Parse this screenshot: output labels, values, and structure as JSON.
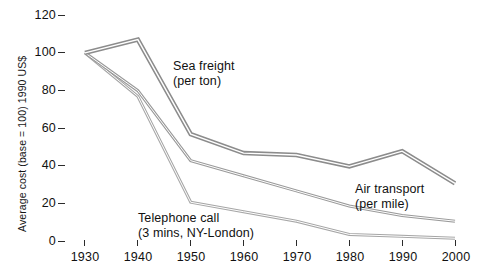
{
  "chart_data": {
    "type": "line",
    "title": "",
    "subtitle": "",
    "xlabel": "",
    "ylabel": "Average cost (base = 100) 1990 US$",
    "x": [
      1930,
      1940,
      1950,
      1960,
      1970,
      1980,
      1990,
      2000
    ],
    "xlim": [
      1930,
      2000
    ],
    "ylim": [
      0,
      120
    ],
    "xticks": [
      "1930",
      "1940",
      "1950",
      "1960",
      "1970",
      "1980",
      "1990",
      "2000"
    ],
    "yticks": [
      "0",
      "20",
      "40",
      "60",
      "80",
      "100",
      "120"
    ],
    "grid": false,
    "legend": "inline-annotations",
    "series": [
      {
        "name": "Sea freight (per ton)",
        "values": [
          100,
          107,
          57,
          47,
          46,
          40,
          48,
          31
        ],
        "color": "#8c8c8c",
        "annotation": {
          "line1": "Sea freight",
          "line2": "(per ton)"
        }
      },
      {
        "name": "Air transport (per mile)",
        "values": [
          100,
          80,
          43,
          35,
          27,
          19,
          14,
          11
        ],
        "color": "#9a9a9a",
        "annotation": {
          "line1": "Air transport",
          "line2": "(per mile)"
        }
      },
      {
        "name": "Telephone call (3 mins, NY-London)",
        "values": [
          100,
          77,
          21,
          16,
          11,
          4,
          3,
          2
        ],
        "color": "#a6a6a6",
        "annotation": {
          "line1": "Telephone call",
          "line2": "(3 mins, NY-London)"
        }
      }
    ]
  },
  "axes": {
    "y_label_text": "Average cost (base = 100) 1990 US$",
    "y_tick_labels": [
      "120",
      "100",
      "80",
      "60",
      "40",
      "20",
      "0"
    ],
    "x_tick_labels": [
      "1930",
      "1940",
      "1950",
      "1960",
      "1970",
      "1980",
      "1990",
      "2000"
    ]
  },
  "annotations": {
    "sea_freight_l1": "Sea freight",
    "sea_freight_l2": "(per ton)",
    "air_transport_l1": "Air transport",
    "air_transport_l2": "(per mile)",
    "telephone_l1": "Telephone call",
    "telephone_l2": "(3 mins, NY-London)"
  },
  "colors": {
    "line_sea": "#8c8c8c",
    "line_air": "#9a9a9a",
    "line_phone": "#a6a6a6",
    "axis": "#2b2b2b",
    "background": "#ffffff"
  }
}
